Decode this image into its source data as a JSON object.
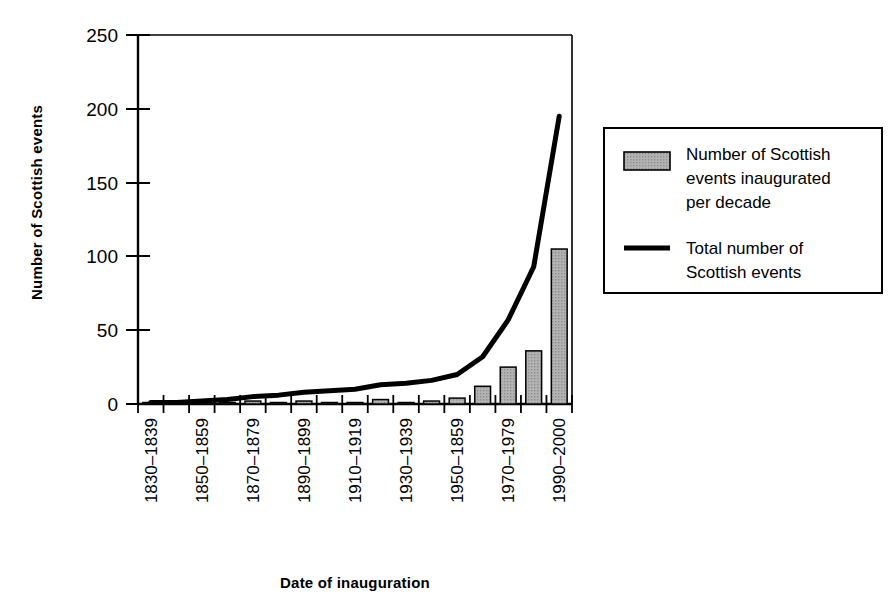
{
  "chart_data": {
    "type": "bar",
    "title": "",
    "xlabel": "Date of inauguration",
    "ylabel": "Number of Scottish events",
    "ylim": [
      0,
      250
    ],
    "yticks": [
      0,
      50,
      100,
      150,
      200,
      250
    ],
    "grid": false,
    "legend_position": "right",
    "categories": [
      "1830–1839",
      "1840–1849",
      "1850–1859",
      "1860–1869",
      "1870–1879",
      "1880–1889",
      "1890–1899",
      "1900–1909",
      "1910–1919",
      "1920–1929",
      "1930–1939",
      "1940–1949",
      "1950–1859",
      "1960–1969",
      "1970–1979",
      "1980–1989",
      "1990–2000"
    ],
    "tick_labels_shown": [
      "1830–1839",
      "",
      "1850–1859",
      "",
      "1870–1879",
      "",
      "1890–1899",
      "",
      "1910–1919",
      "",
      "1930–1939",
      "",
      "1950–1859",
      "",
      "1970–1979",
      "",
      "1990–2000"
    ],
    "series": [
      {
        "name": "Number of Scottish events inaugurated per decade",
        "type": "bar",
        "color": "#a8a8a8",
        "edge_color": "#000000",
        "values": [
          1,
          0,
          1,
          1,
          2,
          1,
          2,
          1,
          1,
          3,
          1,
          2,
          4,
          12,
          25,
          36,
          105
        ]
      },
      {
        "name": "Total number of Scottish events",
        "type": "line",
        "color": "#000000",
        "values": [
          1,
          1,
          2,
          3,
          5,
          6,
          8,
          9,
          10,
          13,
          14,
          16,
          20,
          32,
          57,
          93,
          195
        ]
      }
    ]
  },
  "axes": {
    "y_title": "Number of Scottish events",
    "x_title": "Date of inauguration"
  },
  "legend": {
    "items": [
      {
        "marker": "swatch",
        "color": "#a8a8a8",
        "lines": [
          "Number of Scottish",
          "events inaugurated",
          "per decade"
        ]
      },
      {
        "marker": "line",
        "color": "#000000",
        "lines": [
          "Total number of",
          "Scottish events"
        ]
      }
    ]
  }
}
